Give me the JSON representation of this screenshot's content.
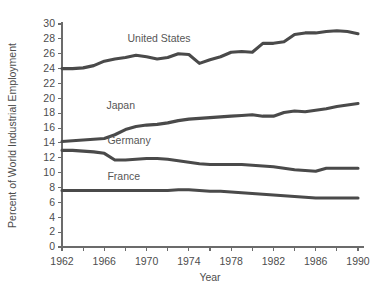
{
  "chart_data": {
    "type": "line",
    "title": "",
    "xlabel": "Year",
    "ylabel": "Percent of World Industrial Employment",
    "xlim": [
      1962,
      1990
    ],
    "ylim": [
      0,
      30
    ],
    "ytick_step": 2,
    "xtick_step": 2,
    "xtick_label_step": 4,
    "grid": false,
    "legend": "inline-series-labels",
    "yticks": [
      0,
      2,
      4,
      6,
      8,
      10,
      12,
      14,
      16,
      18,
      20,
      22,
      24,
      26,
      28,
      30
    ],
    "ytick_labels": [
      "0",
      "2",
      "4",
      "6",
      "8",
      "10",
      "12",
      "14",
      "16",
      "18",
      "20",
      "22",
      "24",
      "26",
      "28",
      "30"
    ],
    "xticks": [
      1962,
      1964,
      1966,
      1968,
      1970,
      1972,
      1974,
      1976,
      1978,
      1980,
      1982,
      1984,
      1986,
      1988,
      1990
    ],
    "xtick_labels": [
      "1962",
      "",
      "1966",
      "",
      "1970",
      "",
      "1974",
      "",
      "1978",
      "",
      "1982",
      "",
      "1986",
      "",
      "1990"
    ],
    "x": [
      1962,
      1963,
      1964,
      1965,
      1966,
      1967,
      1968,
      1969,
      1970,
      1971,
      1972,
      1973,
      1974,
      1975,
      1976,
      1977,
      1978,
      1979,
      1980,
      1981,
      1982,
      1983,
      1984,
      1985,
      1986,
      1987,
      1988,
      1989,
      1990
    ],
    "series": [
      {
        "name": "United States",
        "label": "United States",
        "label_x": 1968.2,
        "label_y": 27.6,
        "color": "#4a4a4a",
        "values": [
          24.0,
          24.0,
          24.1,
          24.4,
          25.0,
          25.3,
          25.5,
          25.8,
          25.6,
          25.3,
          25.5,
          26.0,
          25.9,
          24.7,
          25.2,
          25.6,
          26.2,
          26.3,
          26.2,
          27.4,
          27.4,
          27.6,
          28.6,
          28.8,
          28.8,
          29.0,
          29.1,
          29.0,
          28.7
        ]
      },
      {
        "name": "Japan",
        "label": "Japan",
        "label_x": 1966.2,
        "label_y": 18.5,
        "color": "#4a4a4a",
        "values": [
          14.2,
          14.3,
          14.4,
          14.5,
          14.6,
          15.1,
          15.8,
          16.2,
          16.4,
          16.5,
          16.7,
          17.0,
          17.2,
          17.3,
          17.4,
          17.5,
          17.6,
          17.7,
          17.8,
          17.6,
          17.6,
          18.1,
          18.3,
          18.2,
          18.4,
          18.6,
          18.9,
          19.1,
          19.3
        ]
      },
      {
        "name": "Germany",
        "label": "Germany",
        "label_x": 1966.3,
        "label_y": 13.9,
        "color": "#4a4a4a",
        "values": [
          13.0,
          13.0,
          12.9,
          12.8,
          12.6,
          11.7,
          11.7,
          11.8,
          11.9,
          11.9,
          11.8,
          11.6,
          11.4,
          11.2,
          11.1,
          11.1,
          11.1,
          11.1,
          11.0,
          10.9,
          10.8,
          10.6,
          10.4,
          10.3,
          10.2,
          10.6,
          10.6,
          10.6,
          10.6
        ]
      },
      {
        "name": "France",
        "label": "France",
        "label_x": 1966.3,
        "label_y": 9.0,
        "color": "#4a4a4a",
        "values": [
          7.6,
          7.6,
          7.6,
          7.6,
          7.6,
          7.6,
          7.6,
          7.6,
          7.6,
          7.6,
          7.6,
          7.7,
          7.7,
          7.6,
          7.5,
          7.5,
          7.4,
          7.3,
          7.2,
          7.1,
          7.0,
          6.9,
          6.8,
          6.7,
          6.6,
          6.6,
          6.6,
          6.6,
          6.6
        ]
      }
    ]
  }
}
